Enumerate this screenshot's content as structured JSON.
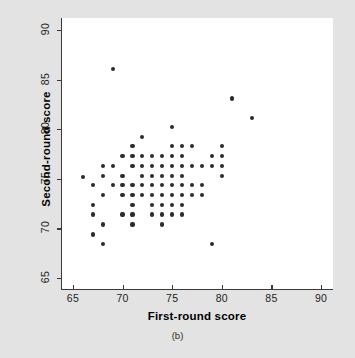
{
  "figure": {
    "caption": "(b)",
    "background_color": "#e3e3e3",
    "plot_background_color": "#ffffff",
    "point_color": "#2b2b2b",
    "axis_color": "#3a3a3a"
  },
  "chart_data": {
    "type": "scatter",
    "title": "",
    "subtitle": "",
    "caption": "(b)",
    "xlabel": "First-round score",
    "ylabel": "Second-round score",
    "xlim": [
      63.8,
      91.2
    ],
    "ylim": [
      63.8,
      91.2
    ],
    "xticks": [
      65,
      70,
      75,
      80,
      85,
      90
    ],
    "yticks": [
      65,
      70,
      75,
      80,
      85,
      90
    ],
    "xticklabels": [
      "65",
      "70",
      "75",
      "80",
      "85",
      "90"
    ],
    "yticklabels": [
      "65",
      "70",
      "75",
      "80",
      "85",
      "90"
    ],
    "grid": false,
    "legend": null,
    "marker": "filled-circle",
    "n_points": 90,
    "x": [
      69,
      81,
      83,
      75,
      72,
      71,
      75,
      76,
      77,
      80,
      70,
      71,
      72,
      73,
      74,
      75,
      76,
      79,
      80,
      68,
      69,
      71,
      72,
      73,
      74,
      75,
      76,
      77,
      78,
      79,
      80,
      67,
      70,
      72,
      73,
      74,
      75,
      79,
      80,
      66,
      69,
      70,
      71,
      72,
      73,
      74,
      75,
      76,
      77,
      78,
      67,
      70,
      72,
      73,
      74,
      75,
      76,
      77,
      78,
      68,
      71,
      73,
      74,
      75,
      76,
      77,
      68,
      71,
      73,
      75,
      76,
      69,
      72,
      74,
      75,
      76,
      68,
      71,
      72,
      74,
      75,
      68,
      70,
      74,
      68,
      69,
      68,
      68,
      79
    ],
    "y": [
      86.1,
      83.1,
      81.1,
      80.2,
      79.2,
      78.3,
      78.3,
      78.3,
      78.3,
      78.3,
      77.3,
      77.3,
      77.3,
      77.3,
      77.3,
      77.3,
      77.3,
      77.3,
      77.3,
      76.3,
      76.3,
      76.3,
      76.3,
      76.3,
      76.3,
      76.3,
      76.3,
      76.3,
      76.3,
      76.3,
      76.3,
      75.3,
      75.3,
      75.3,
      75.3,
      75.3,
      75.3,
      75.3,
      75.3,
      75.2,
      74.4,
      74.4,
      74.4,
      74.4,
      74.4,
      74.4,
      74.4,
      74.4,
      74.4,
      74.4,
      74.4,
      73.4,
      73.4,
      73.4,
      73.4,
      73.4,
      73.4,
      73.4,
      73.4,
      73.4,
      72.4,
      72.4,
      72.4,
      72.4,
      72.4,
      72.4,
      72.4,
      71.4,
      71.4,
      71.4,
      71.4,
      71.4,
      71.4,
      71.4,
      71.4,
      71.4,
      70.4,
      70.4,
      70.4,
      70.4,
      70.4,
      69.4,
      70.4,
      70.4,
      69.4,
      68.4,
      68.4,
      71.4,
      68.4
    ],
    "points": [
      {
        "x": 69,
        "y": 86.1
      },
      {
        "x": 81,
        "y": 83.1
      },
      {
        "x": 83,
        "y": 81.1
      },
      {
        "x": 75,
        "y": 80.2
      },
      {
        "x": 72,
        "y": 79.2
      },
      {
        "x": 71,
        "y": 78.3
      },
      {
        "x": 75,
        "y": 78.3
      },
      {
        "x": 76,
        "y": 78.3
      },
      {
        "x": 77,
        "y": 78.3
      },
      {
        "x": 80,
        "y": 78.3
      },
      {
        "x": 70,
        "y": 77.3
      },
      {
        "x": 71,
        "y": 77.3
      },
      {
        "x": 72,
        "y": 77.3
      },
      {
        "x": 73,
        "y": 77.3
      },
      {
        "x": 74,
        "y": 77.3
      },
      {
        "x": 75,
        "y": 77.3
      },
      {
        "x": 76,
        "y": 77.3
      },
      {
        "x": 79,
        "y": 77.3
      },
      {
        "x": 80,
        "y": 77.3
      },
      {
        "x": 68,
        "y": 76.3
      },
      {
        "x": 69,
        "y": 76.3
      },
      {
        "x": 71,
        "y": 76.3
      },
      {
        "x": 72,
        "y": 76.3
      },
      {
        "x": 73,
        "y": 76.3
      },
      {
        "x": 74,
        "y": 76.3
      },
      {
        "x": 75,
        "y": 76.3
      },
      {
        "x": 76,
        "y": 76.3
      },
      {
        "x": 77,
        "y": 76.3
      },
      {
        "x": 78,
        "y": 76.3
      },
      {
        "x": 79,
        "y": 76.3
      },
      {
        "x": 80,
        "y": 76.3
      },
      {
        "x": 66,
        "y": 75.2
      },
      {
        "x": 68,
        "y": 75.3
      },
      {
        "x": 70,
        "y": 75.3
      },
      {
        "x": 72,
        "y": 75.3
      },
      {
        "x": 73,
        "y": 75.3
      },
      {
        "x": 74,
        "y": 75.3
      },
      {
        "x": 75,
        "y": 75.3
      },
      {
        "x": 76,
        "y": 75.3
      },
      {
        "x": 80,
        "y": 75.3
      },
      {
        "x": 67,
        "y": 74.4
      },
      {
        "x": 69,
        "y": 74.4
      },
      {
        "x": 70,
        "y": 74.4
      },
      {
        "x": 71,
        "y": 74.4
      },
      {
        "x": 72,
        "y": 74.4
      },
      {
        "x": 73,
        "y": 74.4
      },
      {
        "x": 74,
        "y": 74.4
      },
      {
        "x": 75,
        "y": 74.4
      },
      {
        "x": 76,
        "y": 74.4
      },
      {
        "x": 77,
        "y": 74.4
      },
      {
        "x": 78,
        "y": 74.4
      },
      {
        "x": 68,
        "y": 73.4
      },
      {
        "x": 70,
        "y": 73.4
      },
      {
        "x": 71,
        "y": 73.4
      },
      {
        "x": 72,
        "y": 73.4
      },
      {
        "x": 73,
        "y": 73.4
      },
      {
        "x": 74,
        "y": 73.4
      },
      {
        "x": 75,
        "y": 73.4
      },
      {
        "x": 76,
        "y": 73.4
      },
      {
        "x": 77,
        "y": 73.4
      },
      {
        "x": 78,
        "y": 73.4
      },
      {
        "x": 67,
        "y": 72.4
      },
      {
        "x": 71,
        "y": 72.4
      },
      {
        "x": 73,
        "y": 72.4
      },
      {
        "x": 74,
        "y": 72.4
      },
      {
        "x": 75,
        "y": 72.4
      },
      {
        "x": 76,
        "y": 72.4
      },
      {
        "x": 67,
        "y": 71.4
      },
      {
        "x": 70,
        "y": 71.4
      },
      {
        "x": 71,
        "y": 71.4
      },
      {
        "x": 73,
        "y": 71.4
      },
      {
        "x": 74,
        "y": 71.4
      },
      {
        "x": 75,
        "y": 71.4
      },
      {
        "x": 76,
        "y": 71.4
      },
      {
        "x": 68,
        "y": 70.4
      },
      {
        "x": 71,
        "y": 70.4
      },
      {
        "x": 74,
        "y": 70.4
      },
      {
        "x": 67,
        "y": 69.4
      },
      {
        "x": 68,
        "y": 68.4
      },
      {
        "x": 79,
        "y": 68.4
      }
    ]
  }
}
